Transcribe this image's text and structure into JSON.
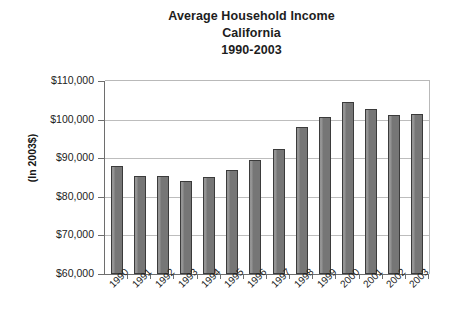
{
  "chart_data": {
    "type": "bar",
    "title": "Average Household Income California 1990-2003",
    "title_lines": [
      "Average Household Income",
      "California",
      "1990-2003"
    ],
    "xlabel": "",
    "ylabel": "(In 2003$)",
    "categories": [
      "1990",
      "1991",
      "1992",
      "1993",
      "1994",
      "1995",
      "1996",
      "1997",
      "1998",
      "1999",
      "2000",
      "2001",
      "2002",
      "2003"
    ],
    "values": [
      87900,
      85300,
      85500,
      84100,
      85100,
      86900,
      89500,
      92400,
      98000,
      100800,
      104600,
      102700,
      101100,
      101400
    ],
    "ylim": [
      60000,
      110000
    ],
    "ytick_labels": [
      "$110,000",
      "$100,000",
      "$90,000",
      "$80,000",
      "$70,000",
      "$60,000"
    ],
    "ytick_values": [
      110000,
      100000,
      90000,
      80000,
      70000,
      60000
    ],
    "grid": true,
    "legend": false,
    "bar_color": "#7c7c7c",
    "bar_edge_color": "#3b3b3b",
    "grid_color": "#bdbdbd",
    "axis_color": "#6e6e6e",
    "background_color": "#ffffff"
  }
}
